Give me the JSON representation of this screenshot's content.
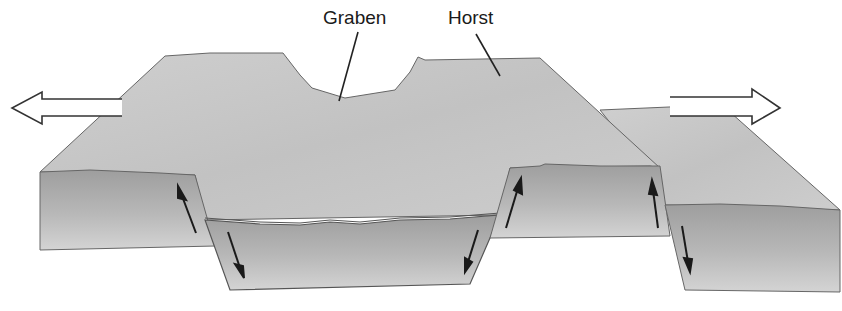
{
  "diagram": {
    "type": "fault-block-diagram",
    "labels": {
      "graben": "Graben",
      "horst": "Horst"
    },
    "arrows": {
      "left": "extension-left",
      "right": "extension-right"
    },
    "colors": {
      "surface": "#c8c8c8",
      "block_top": "#a9a9a9",
      "block_bottom": "#d2d2d2",
      "outline": "#555555",
      "arrow": "#1a1a1a"
    }
  }
}
